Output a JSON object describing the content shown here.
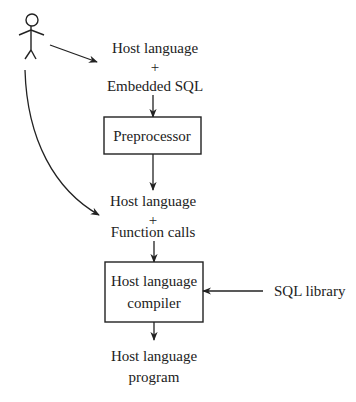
{
  "diagram": {
    "type": "flowchart",
    "colors": {
      "stroke": "#222222",
      "text": "#222222",
      "background": "#ffffff"
    },
    "actor": {
      "name": "programmer",
      "icon": "stick-figure-icon"
    },
    "nodes": {
      "source": {
        "line1": "Host language",
        "line2": "+",
        "line3": "Embedded SQL"
      },
      "preprocessor": {
        "label": "Preprocessor"
      },
      "intermediate": {
        "line1": "Host language",
        "line2": "+",
        "line3": "Function calls"
      },
      "compiler": {
        "line1": "Host language",
        "line2": "compiler"
      },
      "library": {
        "label": "SQL library"
      },
      "output": {
        "line1": "Host language",
        "line2": "program"
      }
    },
    "edges": [
      {
        "from": "actor",
        "to": "source"
      },
      {
        "from": "actor",
        "to": "intermediate"
      },
      {
        "from": "source",
        "to": "preprocessor"
      },
      {
        "from": "preprocessor",
        "to": "intermediate"
      },
      {
        "from": "intermediate",
        "to": "compiler"
      },
      {
        "from": "library",
        "to": "compiler"
      },
      {
        "from": "compiler",
        "to": "output"
      }
    ]
  }
}
